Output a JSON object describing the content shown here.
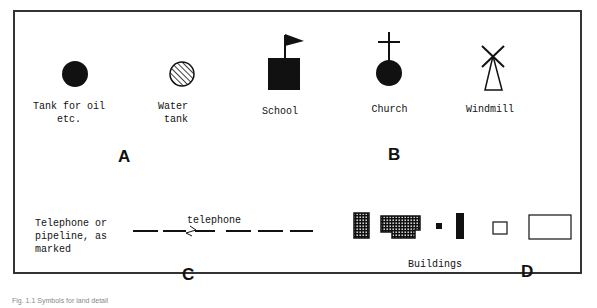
{
  "panel_a": {
    "letter": "A",
    "symbols": [
      {
        "icon": "filled-circle-icon",
        "label": "Tank for oil\n    etc."
      },
      {
        "icon": "hatched-circle-icon",
        "label": "Water\n tank"
      },
      {
        "icon": "flag-square-icon",
        "label": "School"
      }
    ]
  },
  "panel_b": {
    "letter": "B",
    "symbols": [
      {
        "icon": "cross-circle-icon",
        "label": "Church"
      },
      {
        "icon": "windmill-icon",
        "label": "Windmill"
      }
    ]
  },
  "panel_c": {
    "letter": "C",
    "label": "Telephone or\npipeline, as\nmarked",
    "line_label": "telephone"
  },
  "panel_d": {
    "letter": "D",
    "label": "Buildings"
  },
  "caption": "Fig. 1.1  Symbols for land detail"
}
